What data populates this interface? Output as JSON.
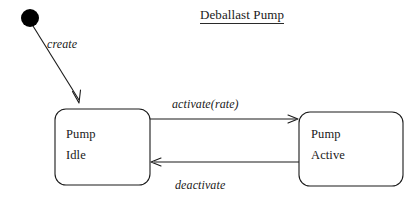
{
  "diagram": {
    "type": "uml-state-diagram",
    "title": "Deballast Pump",
    "title_underlined": true,
    "background_color": "#ffffff",
    "stroke_color": "#1a1a1a",
    "states": [
      {
        "id": "initial",
        "kind": "initial-pseudostate",
        "shape": "filled-circle",
        "label": "",
        "cx": 30,
        "cy": 18,
        "r": 9,
        "fill": "#000000"
      },
      {
        "id": "pump-idle",
        "kind": "state",
        "shape": "rounded-rectangle",
        "line1": "Pump",
        "line2": "Idle",
        "x": 55,
        "y": 109,
        "width": 95,
        "height": 76
      },
      {
        "id": "pump-active",
        "kind": "state",
        "shape": "rounded-rectangle",
        "line1": "Pump",
        "line2": "Active",
        "x": 299,
        "y": 112,
        "width": 104,
        "height": 74
      }
    ],
    "transitions": [
      {
        "id": "create",
        "label": "create",
        "from": "initial",
        "to": "pump-idle",
        "style": "diagonal-arrow",
        "arrowhead": "open"
      },
      {
        "id": "activate",
        "label": "activate(rate)",
        "from": "pump-idle",
        "to": "pump-active",
        "style": "horizontal-arrow-right",
        "arrowhead": "open"
      },
      {
        "id": "deactivate",
        "label": "deactivate",
        "from": "pump-active",
        "to": "pump-idle",
        "style": "horizontal-arrow-left",
        "arrowhead": "open"
      }
    ]
  }
}
